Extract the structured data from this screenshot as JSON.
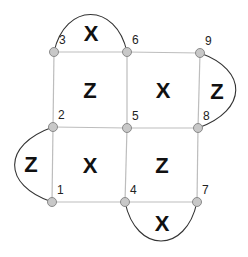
{
  "diagram": {
    "type": "surface-code-lattice",
    "nodes": [
      {
        "id": "1",
        "label": "1",
        "x": 52,
        "y": 202
      },
      {
        "id": "2",
        "label": "2",
        "x": 53,
        "y": 127
      },
      {
        "id": "3",
        "label": "3",
        "x": 54,
        "y": 52
      },
      {
        "id": "4",
        "label": "4",
        "x": 125,
        "y": 202
      },
      {
        "id": "5",
        "label": "5",
        "x": 127,
        "y": 128
      },
      {
        "id": "6",
        "label": "6",
        "x": 127,
        "y": 52
      },
      {
        "id": "7",
        "label": "7",
        "x": 197,
        "y": 202
      },
      {
        "id": "8",
        "label": "8",
        "x": 198,
        "y": 128
      },
      {
        "id": "9",
        "label": "9",
        "x": 200,
        "y": 53
      }
    ],
    "plaquettes": [
      {
        "label": "Z",
        "x": 90,
        "y": 90
      },
      {
        "label": "X",
        "x": 163,
        "y": 90
      },
      {
        "label": "X",
        "x": 90,
        "y": 165
      },
      {
        "label": "Z",
        "x": 162,
        "y": 165
      }
    ],
    "boundary_plaquettes": [
      {
        "label": "X",
        "x": 91,
        "y": 33,
        "between": [
          "3",
          "6"
        ]
      },
      {
        "label": "Z",
        "x": 217,
        "y": 91,
        "between": [
          "9",
          "8"
        ]
      },
      {
        "label": "Z",
        "x": 31,
        "y": 164,
        "between": [
          "2",
          "1"
        ]
      },
      {
        "label": "X",
        "x": 162,
        "y": 223,
        "between": [
          "4",
          "7"
        ]
      }
    ]
  }
}
